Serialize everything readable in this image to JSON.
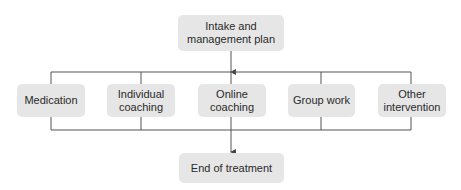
{
  "diagram": {
    "type": "flowchart",
    "colors": {
      "node_fill": "#e6e6e6",
      "line": "#555555",
      "text": "#2a2a2a"
    },
    "start_node": {
      "label": "Intake and management plan"
    },
    "interventions": [
      {
        "label": "Medication"
      },
      {
        "label": "Individual coaching"
      },
      {
        "label": "Online coaching"
      },
      {
        "label": "Group work"
      },
      {
        "label": "Other intervention"
      }
    ],
    "end_node": {
      "label": "End of treatment"
    },
    "edges": [
      {
        "from": "Intake and management plan",
        "to": "interventions (branch)",
        "arrow": true
      },
      {
        "from": "interventions (merge)",
        "to": "End of treatment",
        "arrow": true
      }
    ]
  }
}
